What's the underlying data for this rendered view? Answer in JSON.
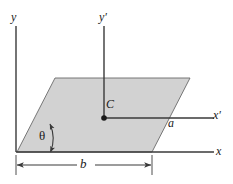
{
  "figure": {
    "type": "geometry-diagram",
    "background_color": "#ffffff",
    "line_color": "#3a3a3a",
    "fill_color": "#d2d2d2",
    "labels": {
      "y_axis": "y",
      "y_prime_axis": "y′",
      "x_axis": "x",
      "x_prime_axis": "x′",
      "centroid": "C",
      "side_a": "a",
      "base_b": "b",
      "angle_theta": "θ"
    },
    "geometry": {
      "parallelogram_vertices": [
        [
          17,
          152
        ],
        [
          55,
          78
        ],
        [
          190,
          78
        ],
        [
          152,
          152
        ]
      ],
      "centroid_point": [
        104,
        118
      ],
      "y_axis_line": [
        [
          16,
          26
        ],
        [
          16,
          152
        ]
      ],
      "x_axis_line": [
        [
          16,
          152
        ],
        [
          212,
          152
        ]
      ],
      "y_prime_axis_line": [
        [
          104,
          26
        ],
        [
          104,
          118
        ]
      ],
      "x_prime_axis_line": [
        [
          104,
          118
        ],
        [
          212,
          118
        ]
      ],
      "dimension_line_b": [
        [
          16,
          165
        ],
        [
          152,
          165
        ]
      ],
      "angle_arc_center": [
        17,
        152
      ],
      "angle_arc_radius": 34
    },
    "icons": {
      "centroid_marker": "filled-dot",
      "dimension_arrows": "double-headed-arrow",
      "angle_arrows": "double-headed-arc"
    }
  }
}
